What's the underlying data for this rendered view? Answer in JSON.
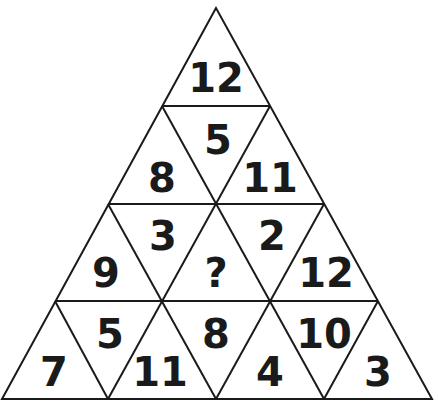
{
  "puzzle": {
    "type": "triangle-number-puzzle",
    "line_color": "#1a1a1a",
    "cells": [
      {
        "id": "r1-up-1",
        "value": "12"
      },
      {
        "id": "r2-up-1",
        "value": "8"
      },
      {
        "id": "r2-down-1",
        "value": "5"
      },
      {
        "id": "r2-up-2",
        "value": "11"
      },
      {
        "id": "r3-up-1",
        "value": "9"
      },
      {
        "id": "r3-down-1",
        "value": "3"
      },
      {
        "id": "r3-up-2",
        "value": "?"
      },
      {
        "id": "r3-down-2",
        "value": "2"
      },
      {
        "id": "r3-up-3",
        "value": "12"
      },
      {
        "id": "r4-up-1",
        "value": "7"
      },
      {
        "id": "r4-down-1",
        "value": "5"
      },
      {
        "id": "r4-up-2",
        "value": "11"
      },
      {
        "id": "r4-down-2",
        "value": "8"
      },
      {
        "id": "r4-up-3",
        "value": "4"
      },
      {
        "id": "r4-down-3",
        "value": "10"
      },
      {
        "id": "r4-up-4",
        "value": "3"
      }
    ]
  }
}
